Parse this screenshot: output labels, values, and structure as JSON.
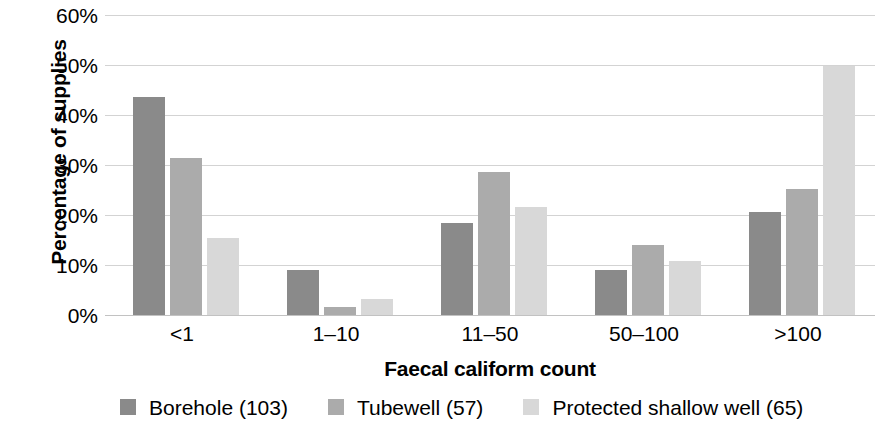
{
  "chart_data": {
    "type": "bar",
    "title": "",
    "xlabel": "Faecal caliform count",
    "ylabel": "Percentage of supplies",
    "categories": [
      "<1",
      "1–10",
      "11–50",
      "50–100",
      ">100"
    ],
    "series": [
      {
        "name": "Borehole (103)",
        "color": "#8a8a8a",
        "values": [
          43.6,
          9.0,
          18.4,
          9.1,
          20.6
        ]
      },
      {
        "name": "Tubewell (57)",
        "color": "#ababab",
        "values": [
          31.5,
          1.6,
          28.6,
          14.1,
          25.2
        ]
      },
      {
        "name": "Protected shallow well (65)",
        "color": "#d8d8d8",
        "values": [
          15.4,
          3.2,
          21.6,
          10.9,
          49.8
        ]
      }
    ],
    "ylim": [
      0,
      60
    ],
    "ytick_values": [
      0,
      10,
      20,
      30,
      40,
      50,
      60
    ],
    "ytick_labels": [
      "0%",
      "10%",
      "20%",
      "30%",
      "40%",
      "50%",
      "60%"
    ],
    "grid": true,
    "legend_position": "bottom",
    "axis_color": "#c2c2c2",
    "grid_color": "#d3d3d3"
  },
  "legend": {
    "items": [
      {
        "label": "Borehole (103)",
        "color": "#8a8a8a"
      },
      {
        "label": "Tubewell (57)",
        "color": "#ababab"
      },
      {
        "label": "Protected shallow well (65)",
        "color": "#d8d8d8"
      }
    ]
  }
}
